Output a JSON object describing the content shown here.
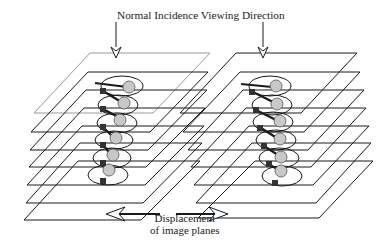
{
  "figure": {
    "title": "Normal Incidence Viewing Direction",
    "displacement_label_line1": "Displacement",
    "displacement_label_line2": "of image planes",
    "stacks": [
      {
        "name": "left-stack",
        "planes": 7,
        "helix_atoms": 6
      },
      {
        "name": "right-stack",
        "planes": 7,
        "helix_atoms": 6
      }
    ],
    "colors": {
      "line": "#1a1a1a",
      "top_plane": "#9a9a9a",
      "atom_fill": "#c8c8c8",
      "square_fill": "#333333"
    }
  }
}
